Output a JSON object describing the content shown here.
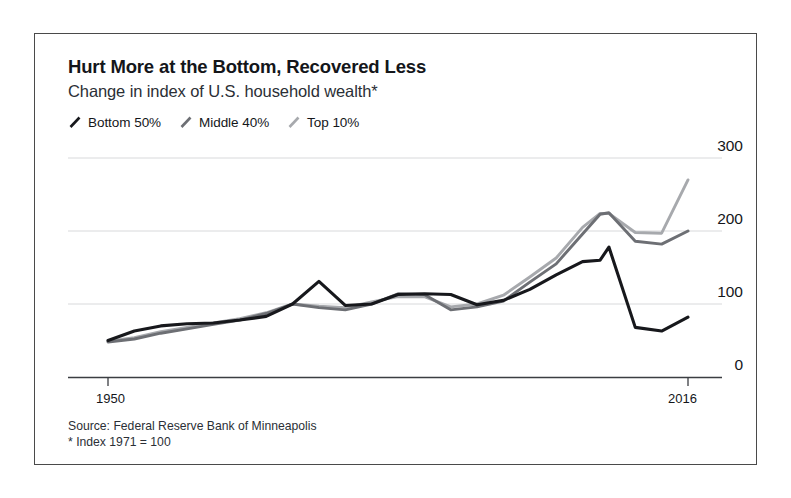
{
  "figure": {
    "title": "Hurt More at the Bottom, Recovered Less",
    "subtitle": "Change in index of U.S. household wealth*",
    "source": "Source: Federal Reserve Bank of Minneapolis",
    "footnote": "* Index 1971 = 100",
    "border_color": "#4a4a4a",
    "background": "#ffffff"
  },
  "legend": [
    {
      "label": "Bottom 50%",
      "color": "#17181c",
      "icon": "line-slash-icon"
    },
    {
      "label": "Middle 40%",
      "color": "#6d6f74",
      "icon": "line-slash-icon"
    },
    {
      "label": "Top 10%",
      "color": "#a7a9ad",
      "icon": "line-slash-icon"
    }
  ],
  "axis": {
    "y_ticks": [
      "300",
      "200",
      "100",
      "0"
    ],
    "x_ticks": [
      "1950",
      "2016"
    ]
  },
  "chart_data": {
    "type": "line",
    "title": "Hurt More at the Bottom, Recovered Less",
    "subtitle": "Change in index of U.S. household wealth*",
    "xlabel": "",
    "ylabel": "",
    "xlim": [
      1950,
      2016
    ],
    "ylim": [
      0,
      300
    ],
    "grid": true,
    "gridlines": [
      100,
      200,
      300
    ],
    "legend_position": "top-left",
    "x": [
      1950,
      1953,
      1956,
      1959,
      1962,
      1965,
      1968,
      1971,
      1974,
      1977,
      1980,
      1983,
      1986,
      1989,
      1992,
      1995,
      1998,
      2001,
      2004,
      2006,
      2007,
      2010,
      2013,
      2016
    ],
    "series": [
      {
        "name": "Bottom 50%",
        "color": "#17181c",
        "values": [
          50,
          63,
          70,
          73,
          74,
          78,
          83,
          100,
          131,
          98,
          100,
          113,
          114,
          113,
          99,
          105,
          120,
          140,
          158,
          160,
          178,
          68,
          63,
          82
        ]
      },
      {
        "name": "Middle 40%",
        "color": "#6d6f74",
        "values": [
          48,
          52,
          60,
          66,
          72,
          78,
          87,
          100,
          95,
          92,
          100,
          114,
          113,
          92,
          96,
          104,
          130,
          155,
          196,
          223,
          225,
          186,
          182,
          200
        ]
      },
      {
        "name": "Top 10%",
        "color": "#a7a9ad",
        "values": [
          49,
          54,
          62,
          68,
          74,
          80,
          88,
          100,
          97,
          95,
          103,
          110,
          110,
          96,
          100,
          112,
          137,
          163,
          205,
          224,
          224,
          198,
          197,
          270
        ]
      }
    ]
  }
}
